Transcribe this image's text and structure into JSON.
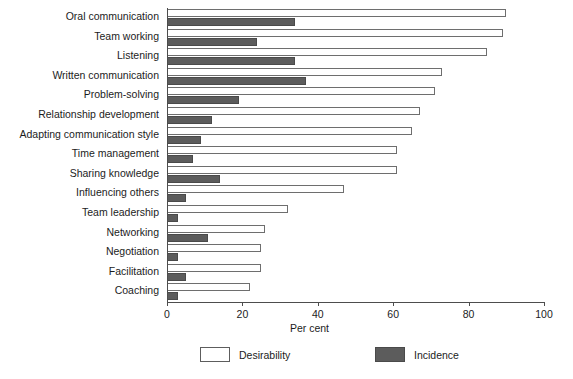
{
  "chart_data": {
    "type": "bar",
    "orientation": "horizontal",
    "title": "",
    "xlabel": "Per cent",
    "ylabel": "",
    "xlim": [
      0,
      100
    ],
    "xticks": [
      0,
      20,
      40,
      60,
      80,
      100
    ],
    "grid": false,
    "legend_position": "bottom",
    "categories": [
      "Oral communication",
      "Team working",
      "Listening",
      "Written communication",
      "Problem-solving",
      "Relationship development",
      "Adapting communication style",
      "Time management",
      "Sharing knowledge",
      "Influencing others",
      "Team leadership",
      "Networking",
      "Negotiation",
      "Facilitation",
      "Coaching"
    ],
    "series": [
      {
        "name": "Desirability",
        "color": "#ffffff",
        "values": [
          90,
          89,
          85,
          73,
          71,
          67,
          65,
          61,
          61,
          47,
          32,
          26,
          25,
          25,
          22
        ]
      },
      {
        "name": "Incidence",
        "color": "#5c5c5c",
        "values": [
          34,
          24,
          34,
          37,
          19,
          12,
          9,
          7,
          14,
          5,
          3,
          11,
          3,
          5,
          3
        ]
      }
    ]
  },
  "legend": {
    "items": [
      {
        "label": "Desirability",
        "swatch": "desirability"
      },
      {
        "label": "Incidence",
        "swatch": "incidence"
      }
    ]
  }
}
